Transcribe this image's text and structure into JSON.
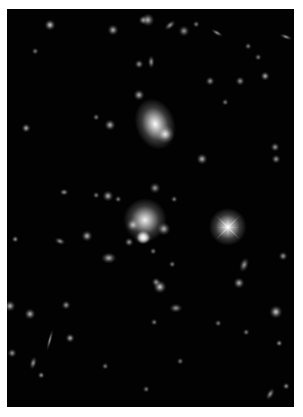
{
  "image": {
    "description": "Deep-field astronomical image of a galaxy cluster on black sky",
    "background": "#020202",
    "border": "#ffffff",
    "field": {
      "x": 7,
      "y": 9,
      "width": 287,
      "height": 398
    }
  },
  "objects": [
    {
      "type": "galaxy",
      "x": 155,
      "y": 124,
      "rx": 9,
      "ry": 12,
      "b": 1.0,
      "rot": -20
    },
    {
      "type": "galaxy",
      "x": 165,
      "y": 134,
      "rx": 4,
      "ry": 4,
      "b": 0.9,
      "rot": 0
    },
    {
      "type": "galaxy",
      "x": 145,
      "y": 220,
      "rx": 10,
      "ry": 10,
      "b": 0.95,
      "rot": 0
    },
    {
      "type": "star",
      "x": 228,
      "y": 227,
      "rx": 6,
      "ry": 6,
      "b": 1.0,
      "rot": 0,
      "spikes": true
    },
    {
      "type": "galaxy",
      "x": 143,
      "y": 237,
      "rx": 3,
      "ry": 3,
      "b": 0.8,
      "rot": 0
    },
    {
      "type": "galaxy",
      "x": 143,
      "y": 238,
      "rx": 4,
      "ry": 3,
      "b": 0.7,
      "rot": 0
    },
    {
      "type": "galaxy",
      "x": 144,
      "y": 237,
      "rx": 3,
      "ry": 3,
      "b": 0.7,
      "rot": 0
    },
    {
      "type": "galaxy",
      "x": 143,
      "y": 238,
      "rx": 3,
      "ry": 3,
      "b": 0.7,
      "rot": 0
    },
    {
      "type": "galaxy",
      "x": 144,
      "y": 238,
      "rx": 3,
      "ry": 2,
      "b": 0.7,
      "rot": 0
    },
    {
      "type": "galaxy",
      "x": 133,
      "y": 225,
      "rx": 3,
      "ry": 3,
      "b": 0.7,
      "rot": 0
    },
    {
      "type": "galaxy",
      "x": 164,
      "y": 229,
      "rx": 3,
      "ry": 3,
      "b": 0.7,
      "rot": 0
    },
    {
      "type": "galaxy",
      "x": 143,
      "y": 237,
      "rx": 3,
      "ry": 3,
      "b": 0.6,
      "rot": 0
    },
    {
      "type": "galaxy",
      "x": 148,
      "y": 20,
      "rx": 3,
      "ry": 3,
      "b": 0.7,
      "rot": 0
    },
    {
      "type": "galaxy",
      "x": 143,
      "y": 20,
      "rx": 2,
      "ry": 2,
      "b": 0.6,
      "rot": 0
    },
    {
      "type": "galaxy",
      "x": 50,
      "y": 25,
      "rx": 2.5,
      "ry": 2.5,
      "b": 0.8,
      "rot": 0
    },
    {
      "type": "galaxy",
      "x": 113,
      "y": 30,
      "rx": 2.5,
      "ry": 2.5,
      "b": 0.7,
      "rot": 0
    },
    {
      "type": "galaxy",
      "x": 170,
      "y": 25,
      "rx": 3,
      "ry": 1.5,
      "b": 0.6,
      "rot": -40
    },
    {
      "type": "galaxy",
      "x": 184,
      "y": 31,
      "rx": 2.5,
      "ry": 2.5,
      "b": 0.6,
      "rot": 0
    },
    {
      "type": "galaxy",
      "x": 217,
      "y": 33,
      "rx": 3,
      "ry": 1.2,
      "b": 0.6,
      "rot": 30
    },
    {
      "type": "galaxy",
      "x": 286,
      "y": 37,
      "rx": 3,
      "ry": 1.2,
      "b": 0.6,
      "rot": 20
    },
    {
      "type": "galaxy",
      "x": 139,
      "y": 95,
      "rx": 2.5,
      "ry": 2.5,
      "b": 0.7,
      "rot": 0
    },
    {
      "type": "galaxy",
      "x": 151,
      "y": 62,
      "rx": 1.5,
      "ry": 3,
      "b": 0.6,
      "rot": 0
    },
    {
      "type": "galaxy",
      "x": 139,
      "y": 64,
      "rx": 2,
      "ry": 2,
      "b": 0.6,
      "rot": 0
    },
    {
      "type": "galaxy",
      "x": 110,
      "y": 125,
      "rx": 2.5,
      "ry": 2.5,
      "b": 0.7,
      "rot": 0
    },
    {
      "type": "galaxy",
      "x": 210,
      "y": 81,
      "rx": 2,
      "ry": 2,
      "b": 0.6,
      "rot": 0
    },
    {
      "type": "galaxy",
      "x": 265,
      "y": 76,
      "rx": 2,
      "ry": 2,
      "b": 0.7,
      "rot": 0
    },
    {
      "type": "galaxy",
      "x": 240,
      "y": 81,
      "rx": 2,
      "ry": 2,
      "b": 0.6,
      "rot": 0
    },
    {
      "type": "galaxy",
      "x": 26,
      "y": 128,
      "rx": 2,
      "ry": 2,
      "b": 0.7,
      "rot": 0
    },
    {
      "type": "galaxy",
      "x": 202,
      "y": 159,
      "rx": 2.5,
      "ry": 2.5,
      "b": 0.7,
      "rot": 0
    },
    {
      "type": "galaxy",
      "x": 275,
      "y": 147,
      "rx": 2,
      "ry": 2,
      "b": 0.6,
      "rot": 0
    },
    {
      "type": "galaxy",
      "x": 276,
      "y": 159,
      "rx": 2,
      "ry": 2,
      "b": 0.6,
      "rot": 0
    },
    {
      "type": "galaxy",
      "x": 108,
      "y": 196,
      "rx": 2.5,
      "ry": 2.5,
      "b": 0.7,
      "rot": 0
    },
    {
      "type": "galaxy",
      "x": 155,
      "y": 188,
      "rx": 2.5,
      "ry": 2.5,
      "b": 0.6,
      "rot": 0
    },
    {
      "type": "galaxy",
      "x": 64,
      "y": 192,
      "rx": 2,
      "ry": 1.5,
      "b": 0.6,
      "rot": 0
    },
    {
      "type": "galaxy",
      "x": 87,
      "y": 236,
      "rx": 2.5,
      "ry": 2.5,
      "b": 0.7,
      "rot": 0
    },
    {
      "type": "galaxy",
      "x": 60,
      "y": 241,
      "rx": 2.5,
      "ry": 1.5,
      "b": 0.6,
      "rot": 20
    },
    {
      "type": "galaxy",
      "x": 129,
      "y": 242,
      "rx": 2,
      "ry": 2,
      "b": 0.6,
      "rot": 0
    },
    {
      "type": "galaxy",
      "x": 109,
      "y": 258,
      "rx": 3.5,
      "ry": 2.5,
      "b": 0.7,
      "rot": 0
    },
    {
      "type": "galaxy",
      "x": 244,
      "y": 265,
      "rx": 2,
      "ry": 3.5,
      "b": 0.6,
      "rot": 20
    },
    {
      "type": "galaxy",
      "x": 283,
      "y": 256,
      "rx": 2,
      "ry": 2,
      "b": 0.6,
      "rot": 0
    },
    {
      "type": "galaxy",
      "x": 160,
      "y": 287,
      "rx": 3,
      "ry": 3,
      "b": 0.8,
      "rot": 0
    },
    {
      "type": "galaxy",
      "x": 156,
      "y": 282,
      "rx": 2,
      "ry": 2,
      "b": 0.6,
      "rot": 0
    },
    {
      "type": "galaxy",
      "x": 239,
      "y": 283,
      "rx": 2.5,
      "ry": 2.5,
      "b": 0.7,
      "rot": 0
    },
    {
      "type": "galaxy",
      "x": 176,
      "y": 308,
      "rx": 3,
      "ry": 2,
      "b": 0.6,
      "rot": 0
    },
    {
      "type": "galaxy",
      "x": 276,
      "y": 312,
      "rx": 3,
      "ry": 3,
      "b": 0.8,
      "rot": 0
    },
    {
      "type": "galaxy",
      "x": 10,
      "y": 306,
      "rx": 2.5,
      "ry": 2.5,
      "b": 0.7,
      "rot": 0
    },
    {
      "type": "galaxy",
      "x": 30,
      "y": 314,
      "rx": 2.5,
      "ry": 2.5,
      "b": 0.7,
      "rot": 0
    },
    {
      "type": "galaxy",
      "x": 66,
      "y": 305,
      "rx": 2,
      "ry": 2,
      "b": 0.6,
      "rot": 0
    },
    {
      "type": "galaxy",
      "x": 70,
      "y": 338,
      "rx": 2,
      "ry": 2,
      "b": 0.7,
      "rot": 0
    },
    {
      "type": "galaxy",
      "x": 50,
      "y": 340,
      "rx": 1,
      "ry": 5,
      "b": 0.6,
      "rot": 15
    },
    {
      "type": "galaxy",
      "x": 33,
      "y": 363,
      "rx": 1.5,
      "ry": 3,
      "b": 0.6,
      "rot": 15
    },
    {
      "type": "galaxy",
      "x": 12,
      "y": 353,
      "rx": 2,
      "ry": 2,
      "b": 0.6,
      "rot": 0
    },
    {
      "type": "galaxy",
      "x": 41,
      "y": 375,
      "rx": 1.5,
      "ry": 1.5,
      "b": 0.6,
      "rot": 0
    },
    {
      "type": "galaxy",
      "x": 270,
      "y": 394,
      "rx": 1.5,
      "ry": 3,
      "b": 0.6,
      "rot": 30
    },
    {
      "type": "galaxy",
      "x": 286,
      "y": 386,
      "rx": 1.5,
      "ry": 1.5,
      "b": 0.6,
      "rot": 0
    },
    {
      "type": "galaxy",
      "x": 279,
      "y": 343,
      "rx": 1.5,
      "ry": 1.5,
      "b": 0.6,
      "rot": 0
    },
    {
      "type": "galaxy",
      "x": 15,
      "y": 239,
      "rx": 1.5,
      "ry": 1.5,
      "b": 0.6,
      "rot": 0
    },
    {
      "type": "galaxy",
      "x": 96,
      "y": 195,
      "rx": 1.5,
      "ry": 1.5,
      "b": 0.5,
      "rot": 0
    },
    {
      "type": "galaxy",
      "x": 118,
      "y": 199,
      "rx": 1.5,
      "ry": 1.5,
      "b": 0.5,
      "rot": 0
    },
    {
      "type": "galaxy",
      "x": 174,
      "y": 199,
      "rx": 1.5,
      "ry": 1.5,
      "b": 0.5,
      "rot": 0
    },
    {
      "type": "galaxy",
      "x": 172,
      "y": 264,
      "rx": 1.5,
      "ry": 1.5,
      "b": 0.5,
      "rot": 0
    },
    {
      "type": "galaxy",
      "x": 153,
      "y": 251,
      "rx": 1.5,
      "ry": 1.5,
      "b": 0.5,
      "rot": 0
    },
    {
      "type": "galaxy",
      "x": 96,
      "y": 117,
      "rx": 1.5,
      "ry": 1.5,
      "b": 0.5,
      "rot": 0
    },
    {
      "type": "galaxy",
      "x": 248,
      "y": 46,
      "rx": 1.5,
      "ry": 1.5,
      "b": 0.5,
      "rot": 0
    },
    {
      "type": "galaxy",
      "x": 196,
      "y": 24,
      "rx": 1.5,
      "ry": 1.5,
      "b": 0.5,
      "rot": 0
    },
    {
      "type": "galaxy",
      "x": 35,
      "y": 51,
      "rx": 1.5,
      "ry": 1.5,
      "b": 0.5,
      "rot": 0
    },
    {
      "type": "galaxy",
      "x": 225,
      "y": 102,
      "rx": 1.5,
      "ry": 1.5,
      "b": 0.5,
      "rot": 0
    },
    {
      "type": "galaxy",
      "x": 258,
      "y": 57,
      "rx": 1.5,
      "ry": 1.5,
      "b": 0.5,
      "rot": 0
    },
    {
      "type": "galaxy",
      "x": 218,
      "y": 323,
      "rx": 1.5,
      "ry": 1.5,
      "b": 0.5,
      "rot": 0
    },
    {
      "type": "galaxy",
      "x": 154,
      "y": 322,
      "rx": 1.5,
      "ry": 1.5,
      "b": 0.5,
      "rot": 0
    },
    {
      "type": "galaxy",
      "x": 180,
      "y": 361,
      "rx": 1.5,
      "ry": 1.5,
      "b": 0.5,
      "rot": 0
    },
    {
      "type": "galaxy",
      "x": 105,
      "y": 366,
      "rx": 1.5,
      "ry": 1.5,
      "b": 0.5,
      "rot": 0
    },
    {
      "type": "galaxy",
      "x": 146,
      "y": 389,
      "rx": 1.5,
      "ry": 1.5,
      "b": 0.5,
      "rot": 0
    },
    {
      "type": "galaxy",
      "x": 246,
      "y": 332,
      "rx": 1.5,
      "ry": 1.5,
      "b": 0.5,
      "rot": 0
    }
  ]
}
